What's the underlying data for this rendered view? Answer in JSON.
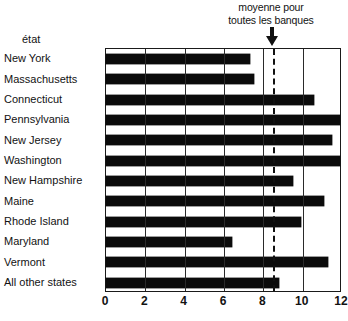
{
  "annotation": {
    "line1": "moyenne pour",
    "line2": "toutes les banques",
    "arrow_icon": "down-arrow-icon",
    "value": 8.5
  },
  "axis_title": "état",
  "bottom_fragment": {
    "left": "",
    "middle": ""
  },
  "chart_data": {
    "type": "bar",
    "orientation": "horizontal",
    "title": "",
    "subtitle": "",
    "xlabel": "",
    "ylabel": "état",
    "xlim": [
      0,
      12
    ],
    "xticks": [
      0,
      2,
      4,
      6,
      8,
      10,
      12
    ],
    "xtick_labels": [
      "0",
      "2",
      "4",
      "6",
      "8",
      "10",
      "12"
    ],
    "grid": true,
    "grid_axis": "x",
    "legend": false,
    "bar_color": "#0b0b0b",
    "frame_color": "#1a1a1a",
    "categories": [
      "New York",
      "Massachusetts",
      "Connecticut",
      "Pennsylvania",
      "New Jersey",
      "Washington",
      "New Hampshire",
      "Maine",
      "Rhode Island",
      "Maryland",
      "Vermont",
      "All other states"
    ],
    "values": [
      7.3,
      7.5,
      10.6,
      12.0,
      11.5,
      12.0,
      9.5,
      11.1,
      9.9,
      6.4,
      11.3,
      8.8
    ],
    "annotations": [
      {
        "type": "vline",
        "x": 8.5,
        "style": "dashed",
        "label": "moyenne pour toutes les banques",
        "color": "#111111"
      }
    ]
  }
}
